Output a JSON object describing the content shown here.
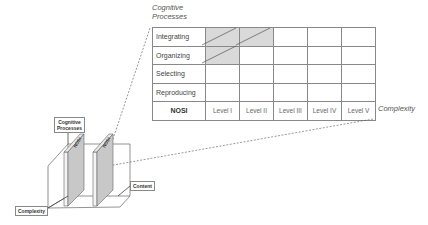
{
  "diagram": {
    "table": {
      "y_axis_title_line1": "Cognitive",
      "y_axis_title_line2": "Processes",
      "x_axis_title": "Complexity",
      "rows": [
        {
          "label": "Integrating",
          "shaded": [
            true,
            true,
            false,
            false,
            false
          ]
        },
        {
          "label": "Organizing",
          "shaded": [
            true,
            false,
            false,
            false,
            false
          ]
        },
        {
          "label": "Selecting",
          "shaded": [
            false,
            false,
            false,
            false,
            false
          ]
        },
        {
          "label": "Reproducing",
          "shaded": [
            false,
            false,
            false,
            false,
            false
          ]
        }
      ],
      "footer_label": "NOSI",
      "levels": [
        "Level I",
        "Level II",
        "Level III",
        "Level IV",
        "Level V"
      ]
    },
    "cube": {
      "label_cognitive_line1": "Cognitive",
      "label_cognitive_line2": "Processes",
      "label_content": "Content",
      "label_complexity": "Complexity",
      "slab_label_1": "NOSI",
      "slab_label_2": "NOSI"
    },
    "colors": {
      "shade": "#d9d9d9",
      "slab_face": "#c8c8c8",
      "grid_line": "#888888"
    }
  }
}
